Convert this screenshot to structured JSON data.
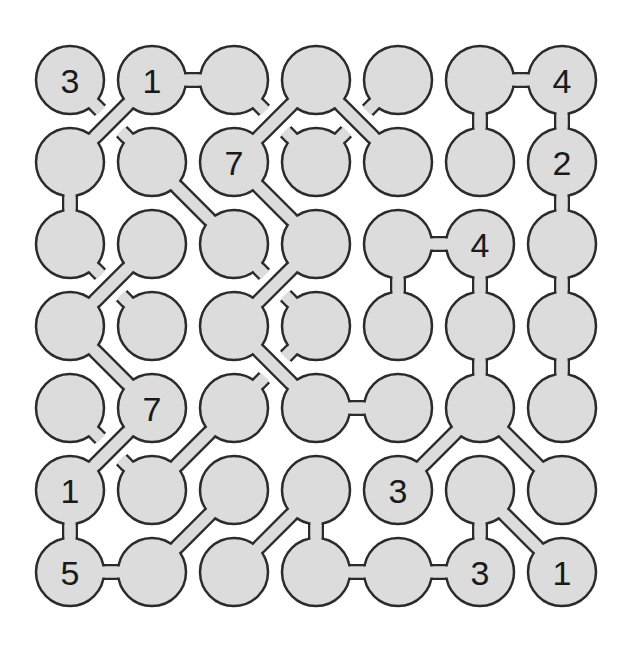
{
  "puzzle": {
    "type": "hashi-like bridges puzzle",
    "rows": 7,
    "cols": 7,
    "colors": {
      "fill": "#dcdcdc",
      "stroke": "#2b2b2b",
      "background": "#ffffff",
      "text": "#1a1a1a"
    },
    "geometry": {
      "x0": 70,
      "y0": 80,
      "step_x": 82,
      "step_y": 82,
      "radius": 34
    },
    "clues": [
      {
        "r": 0,
        "c": 0,
        "v": "3"
      },
      {
        "r": 0,
        "c": 1,
        "v": "1"
      },
      {
        "r": 0,
        "c": 6,
        "v": "4"
      },
      {
        "r": 1,
        "c": 2,
        "v": "7"
      },
      {
        "r": 1,
        "c": 6,
        "v": "2"
      },
      {
        "r": 2,
        "c": 5,
        "v": "4"
      },
      {
        "r": 4,
        "c": 1,
        "v": "7"
      },
      {
        "r": 5,
        "c": 0,
        "v": "1"
      },
      {
        "r": 5,
        "c": 4,
        "v": "3"
      },
      {
        "r": 6,
        "c": 0,
        "v": "5"
      },
      {
        "r": 6,
        "c": 5,
        "v": "3"
      },
      {
        "r": 6,
        "c": 6,
        "v": "1"
      }
    ],
    "links": [
      [
        0,
        1,
        1,
        0
      ],
      [
        0,
        1,
        0,
        2
      ],
      [
        0,
        3,
        1,
        2
      ],
      [
        0,
        3,
        1,
        4
      ],
      [
        0,
        5,
        0,
        6
      ],
      [
        0,
        5,
        1,
        5
      ],
      [
        0,
        6,
        1,
        6
      ],
      [
        1,
        0,
        2,
        0
      ],
      [
        1,
        1,
        2,
        2
      ],
      [
        1,
        2,
        2,
        3
      ],
      [
        1,
        6,
        2,
        6
      ],
      [
        2,
        1,
        3,
        0
      ],
      [
        2,
        3,
        3,
        2
      ],
      [
        2,
        4,
        2,
        5
      ],
      [
        2,
        4,
        3,
        4
      ],
      [
        2,
        5,
        3,
        5
      ],
      [
        2,
        6,
        3,
        6
      ],
      [
        3,
        0,
        4,
        1
      ],
      [
        3,
        2,
        4,
        3
      ],
      [
        3,
        5,
        4,
        5
      ],
      [
        3,
        6,
        4,
        6
      ],
      [
        4,
        1,
        5,
        0
      ],
      [
        4,
        2,
        5,
        1
      ],
      [
        4,
        3,
        4,
        4
      ],
      [
        4,
        5,
        5,
        4
      ],
      [
        4,
        5,
        5,
        6
      ],
      [
        5,
        0,
        6,
        0
      ],
      [
        5,
        2,
        6,
        1
      ],
      [
        5,
        3,
        6,
        2
      ],
      [
        5,
        3,
        6,
        3
      ],
      [
        5,
        5,
        6,
        5
      ],
      [
        5,
        5,
        6,
        6
      ],
      [
        6,
        0,
        6,
        1
      ],
      [
        6,
        3,
        6,
        4
      ],
      [
        6,
        4,
        6,
        5
      ]
    ],
    "stubs": [
      [
        0,
        0,
        "se"
      ],
      [
        1,
        1,
        "nw"
      ],
      [
        0,
        2,
        "se"
      ],
      [
        0,
        4,
        "sw"
      ],
      [
        1,
        3,
        "nw"
      ],
      [
        1,
        3,
        "ne"
      ],
      [
        2,
        0,
        "se"
      ],
      [
        3,
        1,
        "nw"
      ],
      [
        2,
        2,
        "se"
      ],
      [
        3,
        3,
        "nw"
      ],
      [
        3,
        3,
        "sw"
      ],
      [
        4,
        2,
        "ne"
      ],
      [
        4,
        0,
        "se"
      ],
      [
        5,
        1,
        "nw"
      ]
    ]
  }
}
